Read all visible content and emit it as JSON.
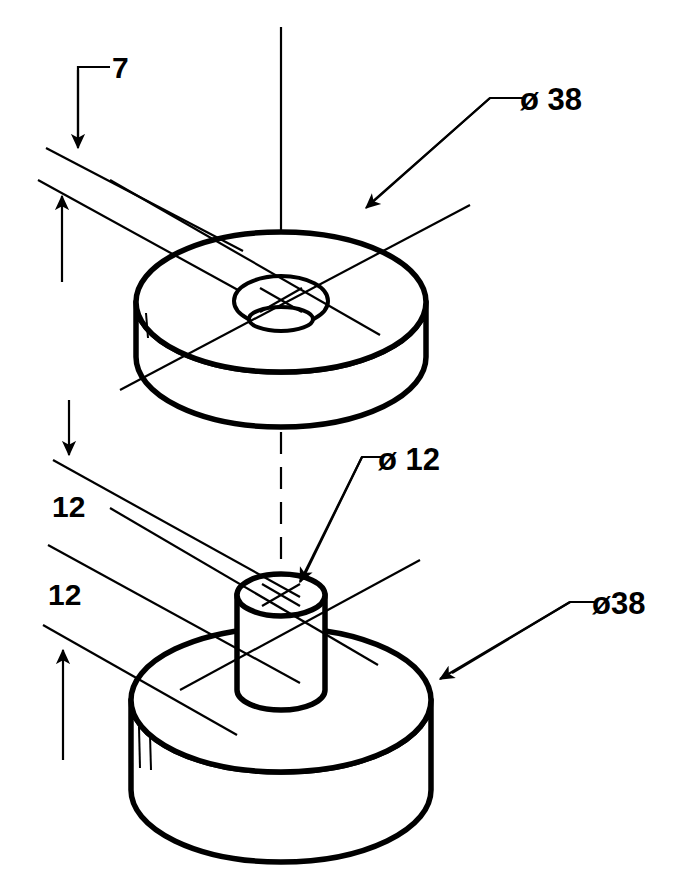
{
  "drawing": {
    "title": "Isometric exploded assembly of two cylindrical parts",
    "background_color": "#ffffff",
    "line_color": "#000000",
    "parts": [
      {
        "name": "upper-washer",
        "description": "Flat annular disc with central through hole",
        "outer_diameter": "38",
        "thickness": "7",
        "bore_diameter": "12"
      },
      {
        "name": "lower-boss-disc",
        "description": "Thick disc with cylindrical boss on top face",
        "outer_diameter": "38",
        "disc_thickness": "12",
        "boss_height": "12",
        "boss_diameter": "12"
      }
    ],
    "dimensions": [
      {
        "id": "thickness-top",
        "label": "7",
        "target": "upper-washer thickness"
      },
      {
        "id": "boss-height",
        "label": "12",
        "target": "lower boss height"
      },
      {
        "id": "disc-thickness",
        "label": "12",
        "target": "lower disc thickness"
      },
      {
        "id": "diameter-top-disc",
        "symbol": "ø",
        "value": "38",
        "label": "ø 38",
        "target": "upper disc outside diameter"
      },
      {
        "id": "diameter-boss",
        "symbol": "ø",
        "value": "12",
        "label": "ø 12",
        "target": "boss diameter"
      },
      {
        "id": "diameter-lower-disc",
        "symbol": "ø",
        "value": "38",
        "label": "ø38",
        "target": "lower disc outside diameter"
      }
    ],
    "labels": {
      "thickness_7": "7",
      "height_12_upper": "12",
      "height_12_lower": "12",
      "dia_38_top": "ø 38",
      "dia_12_boss": "ø 12",
      "dia_38_bottom": "ø38"
    },
    "annotations": {
      "centerline_style": "solid above upper part, dashed between the two parts",
      "shading": "solid black fill on the right-hand side of each cylindrical wall",
      "axis_marks": "centre cross mark drawn at the centre of each circular face"
    }
  }
}
